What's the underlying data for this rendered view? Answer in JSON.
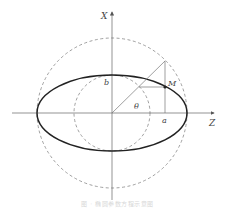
{
  "diagram": {
    "type": "ellipse-parametric-construction",
    "labels": {
      "x_axis": "X",
      "z_axis": "Z",
      "semi_major": "a",
      "semi_minor": "b",
      "angle": "θ",
      "point": "M"
    },
    "caption": "图 · 椭圆参数方程示意图",
    "colors": {
      "axis": "#666666",
      "ellipse": "#222222",
      "circle_dashed": "#888888",
      "construction": "#777777"
    }
  }
}
